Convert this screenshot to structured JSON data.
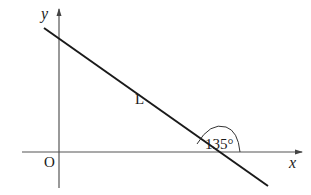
{
  "diagram": {
    "type": "coordinate-plane-line",
    "axes": {
      "x_label": "x",
      "y_label": "y",
      "origin_label": "O"
    },
    "line": {
      "label": "L",
      "angle_with_x_axis": "135°"
    },
    "colors": {
      "axis": "#555555",
      "line": "#1a1a1a",
      "text": "#1a1a1a",
      "background": "#ffffff"
    }
  }
}
